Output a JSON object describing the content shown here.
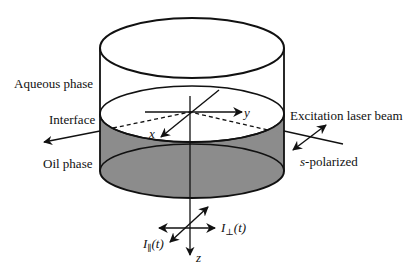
{
  "figure": {
    "labels": {
      "aqueous_phase": "Aqueous phase",
      "interface": "Interface",
      "oil_phase": "Oil phase",
      "excitation_beam": "Excitation laser beam",
      "s_prefix": "s",
      "polarized_suffix": "-polarized"
    },
    "axes": {
      "x": "x",
      "y": "y",
      "z": "z"
    },
    "intensities": {
      "perp_I": "I",
      "perp_sub": "⊥",
      "perp_t": "(t)",
      "par_I": "I",
      "par_sub": "∥",
      "par_t": "(t)"
    },
    "colors": {
      "oil_fill": "#8a8a8a",
      "stroke": "#111111"
    }
  }
}
